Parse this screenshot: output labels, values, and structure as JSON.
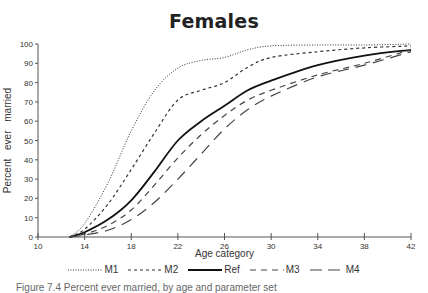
{
  "chart_data": {
    "type": "line",
    "title": "Females",
    "xlabel": "Age category",
    "ylabel": "Percent ever married",
    "xlim": [
      10,
      42
    ],
    "ylim": [
      0,
      100
    ],
    "xticks": [
      10,
      14,
      18,
      22,
      26,
      30,
      34,
      38,
      42
    ],
    "yticks": [
      0,
      10,
      20,
      30,
      40,
      50,
      60,
      70,
      80,
      90,
      100
    ],
    "grid": false,
    "legend_position": "bottom",
    "x": [
      12.7,
      14,
      16,
      18,
      20,
      22,
      24,
      26,
      28,
      30,
      34,
      38,
      42
    ],
    "series": [
      {
        "name": "M1",
        "style": "dotted",
        "values": [
          0,
          7,
          28,
          55,
          76,
          87.5,
          91.5,
          93,
          97,
          99,
          99.5,
          99.5,
          100
        ]
      },
      {
        "name": "M2",
        "style": "short-dash",
        "values": [
          0,
          4,
          17,
          35,
          54,
          71,
          76,
          80,
          88,
          93,
          96,
          98,
          99
        ]
      },
      {
        "name": "Ref",
        "style": "solid",
        "values": [
          0,
          2.5,
          9,
          19,
          34,
          50,
          60,
          68,
          76,
          81,
          89,
          94,
          97
        ]
      },
      {
        "name": "M3",
        "style": "medium-dash",
        "values": [
          0,
          1.5,
          6,
          14,
          27,
          41,
          53,
          63,
          71,
          76,
          84,
          90,
          97
        ]
      },
      {
        "name": "M4",
        "style": "long-dash",
        "values": [
          0,
          1,
          3.5,
          9,
          18,
          30,
          43,
          56,
          66,
          73,
          83,
          89,
          96
        ]
      }
    ]
  },
  "legend": {
    "items": [
      {
        "label": "M1"
      },
      {
        "label": "M2"
      },
      {
        "label": "Ref"
      },
      {
        "label": "M3"
      },
      {
        "label": "M4"
      }
    ]
  },
  "caption": "Figure 7.4 Percent ever married, by age and parameter set"
}
